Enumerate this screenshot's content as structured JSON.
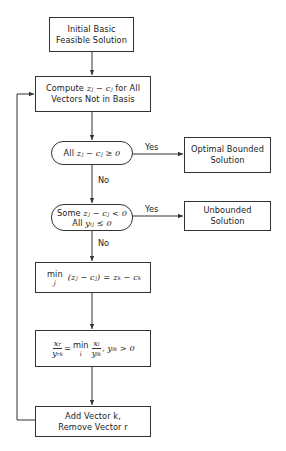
{
  "flowchart": {
    "title": "Simplex Method Flowchart",
    "nodes": {
      "start": {
        "line1": "Initial Basic",
        "line2": "Feasible Solution"
      },
      "compute": {
        "prefix": "Compute",
        "expr": "zⱼ − cⱼ",
        "suffix": "for All",
        "line2": "Vectors Not in Basis"
      },
      "decision_optimal": {
        "prefix": "All",
        "expr": "zⱼ − cⱼ ≥ 0"
      },
      "optimal": {
        "line1": "Optimal Bounded",
        "line2": "Solution"
      },
      "decision_unbounded": {
        "line1_prefix": "Some",
        "line1_expr": "zⱼ − cⱼ < 0",
        "line2_prefix": "All",
        "line2_expr": "yᵢⱼ ≤ 0"
      },
      "unbounded": {
        "line1": "Unbounded",
        "line2": "Solution"
      },
      "entering": {
        "min_label": "min",
        "min_sub": "j",
        "lhs": "(zⱼ − cⱼ)",
        "eq": "=",
        "rhs": "zₖ − cₖ"
      },
      "ratio": {
        "num_lhs": "xᵣ",
        "den_lhs": "yᵣₖ",
        "eq": "=",
        "min_label": "min",
        "min_sub": "i",
        "num_rhs": "xᵢ",
        "den_rhs": "yᵢₖ",
        "cond": ", yᵢₖ > 0"
      },
      "pivot": {
        "line1": "Add Vector k,",
        "line2": "Remove Vector r"
      }
    },
    "edge_labels": {
      "yes_optimal": "Yes",
      "no_optimal": "No",
      "yes_unbounded": "Yes",
      "no_unbounded": "No"
    },
    "colors": {
      "stroke": "#333333",
      "background": "#ffffff",
      "text": "#222222"
    }
  }
}
